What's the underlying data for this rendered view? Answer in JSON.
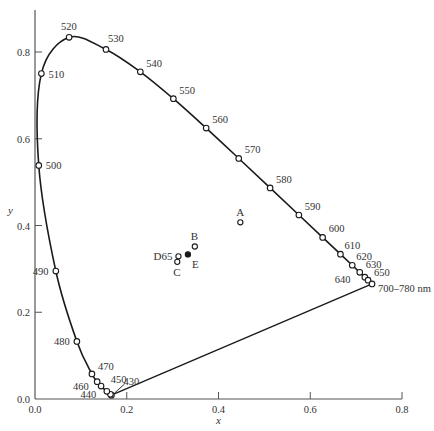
{
  "chart_data": {
    "type": "scatter",
    "title": "",
    "xlabel": "x",
    "ylabel": "y",
    "xlim": [
      0.0,
      0.8
    ],
    "ylim": [
      0.0,
      0.85
    ],
    "grid": false,
    "x_ticks": [
      "0.0",
      "0.2",
      "0.4",
      "0.6",
      "0.8"
    ],
    "y_ticks": [
      "0.0",
      "0.2",
      "0.4",
      "0.6",
      "0.8"
    ],
    "spectral_locus": [
      {
        "wl": "430",
        "x": 0.1666,
        "y": 0.0089,
        "label": "430",
        "dx": 12,
        "dy": -10
      },
      {
        "wl": "440",
        "x": 0.1644,
        "y": 0.0109,
        "label": "440",
        "dx": -30,
        "dy": 4
      },
      {
        "wl": "450",
        "x": 0.1566,
        "y": 0.0177,
        "label": "450",
        "dx": 4,
        "dy": -8
      },
      {
        "wl": "460",
        "x": 0.144,
        "y": 0.0297,
        "label": "460",
        "dx": -28,
        "dy": 4
      },
      {
        "wl": "465",
        "x": 0.1355,
        "y": 0.0399,
        "label": "",
        "dx": 0,
        "dy": 0
      },
      {
        "wl": "470",
        "x": 0.1241,
        "y": 0.0578,
        "label": "470",
        "dx": 6,
        "dy": -4
      },
      {
        "wl": "480",
        "x": 0.0913,
        "y": 0.1327,
        "label": "480",
        "dx": -23,
        "dy": 4
      },
      {
        "wl": "490",
        "x": 0.0454,
        "y": 0.295,
        "label": "490",
        "dx": -23,
        "dy": 4
      },
      {
        "wl": "500",
        "x": 0.0082,
        "y": 0.5384,
        "label": "500",
        "dx": 7,
        "dy": 4
      },
      {
        "wl": "510",
        "x": 0.0139,
        "y": 0.7502,
        "label": "510",
        "dx": 7,
        "dy": 4
      },
      {
        "wl": "520",
        "x": 0.0743,
        "y": 0.8338,
        "label": "520",
        "dx": -8,
        "dy": -7
      },
      {
        "wl": "530",
        "x": 0.1547,
        "y": 0.8059,
        "label": "530",
        "dx": 2,
        "dy": -7
      },
      {
        "wl": "540",
        "x": 0.2296,
        "y": 0.7543,
        "label": "540",
        "dx": 6,
        "dy": -5
      },
      {
        "wl": "550",
        "x": 0.3016,
        "y": 0.6923,
        "label": "550",
        "dx": 6,
        "dy": -5
      },
      {
        "wl": "560",
        "x": 0.3731,
        "y": 0.6245,
        "label": "560",
        "dx": 6,
        "dy": -5
      },
      {
        "wl": "570",
        "x": 0.4441,
        "y": 0.5547,
        "label": "570",
        "dx": 6,
        "dy": -5
      },
      {
        "wl": "580",
        "x": 0.5125,
        "y": 0.4866,
        "label": "580",
        "dx": 6,
        "dy": -5
      },
      {
        "wl": "590",
        "x": 0.5752,
        "y": 0.4242,
        "label": "590",
        "dx": 6,
        "dy": -5
      },
      {
        "wl": "600",
        "x": 0.627,
        "y": 0.3725,
        "label": "600",
        "dx": 6,
        "dy": -5
      },
      {
        "wl": "610",
        "x": 0.6658,
        "y": 0.334,
        "label": "610",
        "dx": 4,
        "dy": -5
      },
      {
        "wl": "620",
        "x": 0.6915,
        "y": 0.3083,
        "label": "620",
        "dx": 4,
        "dy": -5
      },
      {
        "wl": "630",
        "x": 0.7079,
        "y": 0.292,
        "label": "630",
        "dx": 6,
        "dy": -4
      },
      {
        "wl": "640",
        "x": 0.719,
        "y": 0.2809,
        "label": "640",
        "dx": -30,
        "dy": 6
      },
      {
        "wl": "650",
        "x": 0.726,
        "y": 0.274,
        "label": "650",
        "dx": 6,
        "dy": -4
      },
      {
        "wl": "700-780",
        "x": 0.7347,
        "y": 0.2653,
        "label": "700–780 nm",
        "dx": 6,
        "dy": 8
      }
    ],
    "purple_line": {
      "from": "430",
      "to": "700-780"
    },
    "illuminants": [
      {
        "name": "A",
        "x": 0.4476,
        "y": 0.4074,
        "filled": false,
        "label": "A",
        "dx": -4,
        "dy": -6
      },
      {
        "name": "B",
        "x": 0.3484,
        "y": 0.3516,
        "filled": false,
        "label": "B",
        "dx": -4,
        "dy": -6
      },
      {
        "name": "C",
        "x": 0.3101,
        "y": 0.3162,
        "filled": false,
        "label": "C",
        "dx": -4,
        "dy": 14
      },
      {
        "name": "D65",
        "x": 0.3127,
        "y": 0.329,
        "filled": false,
        "label": "D65",
        "dx": -25,
        "dy": 4
      },
      {
        "name": "E",
        "x": 0.3333,
        "y": 0.3333,
        "filled": true,
        "label": "E",
        "dx": 4,
        "dy": 14
      }
    ]
  },
  "colors": {
    "ink": "#1a1a1a",
    "axis": "#555555",
    "text": "#333333",
    "background": "#ffffff"
  }
}
